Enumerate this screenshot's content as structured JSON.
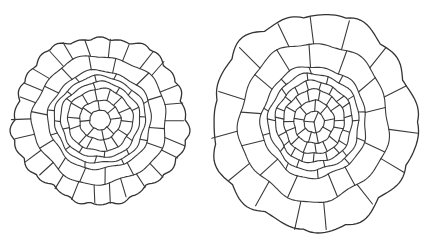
{
  "figure": {
    "colors": {
      "background": "#ffffff",
      "line": "#3a3a3a"
    },
    "sections": [
      {
        "name": "left-section",
        "center": [
          100,
          120
        ],
        "scale": [
          86,
          82
        ],
        "rings": [
          {
            "r_inner": 0.0,
            "r_outer": 0.12,
            "cells": 1
          },
          {
            "r_inner": 0.12,
            "r_outer": 0.24,
            "cells": 8
          },
          {
            "r_inner": 0.24,
            "r_outer": 0.38,
            "cells": 14
          },
          {
            "r_inner": 0.38,
            "r_outer": 0.46,
            "cells": 8
          },
          {
            "r_inner": 0.46,
            "r_outer": 0.53,
            "cells": 8
          },
          {
            "r_inner": 0.53,
            "r_outer": 0.6,
            "cells": 8
          },
          {
            "r_inner": 0.6,
            "r_outer": 0.78,
            "cells": 14
          },
          {
            "r_inner": 0.78,
            "r_outer": 1.0,
            "cells": 26
          }
        ]
      },
      {
        "name": "right-section",
        "center": [
          314,
          122
        ],
        "scale": [
          101,
          107
        ],
        "rings": [
          {
            "r_inner": 0.0,
            "r_outer": 0.1,
            "cells": 3
          },
          {
            "r_inner": 0.1,
            "r_outer": 0.2,
            "cells": 9
          },
          {
            "r_inner": 0.2,
            "r_outer": 0.3,
            "cells": 15
          },
          {
            "r_inner": 0.3,
            "r_outer": 0.38,
            "cells": 19
          },
          {
            "r_inner": 0.38,
            "r_outer": 0.45,
            "cells": 10
          },
          {
            "r_inner": 0.45,
            "r_outer": 0.52,
            "cells": 10
          },
          {
            "r_inner": 0.52,
            "r_outer": 0.74,
            "cells": 13
          },
          {
            "r_inner": 0.74,
            "r_outer": 1.0,
            "cells": 15
          }
        ]
      }
    ]
  }
}
